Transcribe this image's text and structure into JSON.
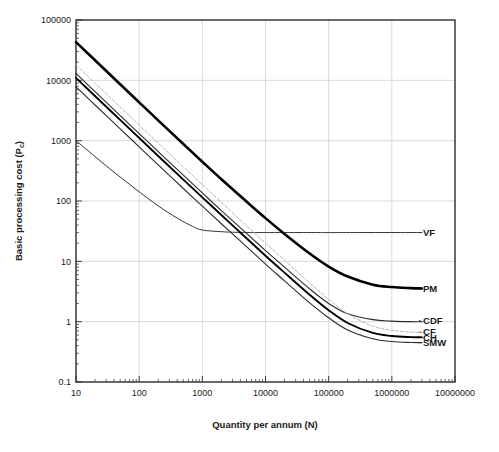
{
  "chart_data": {
    "type": "line",
    "title": "",
    "xlabel": "Quantity per annum (N)",
    "ylabel_prefix": "Basic processing cost (P",
    "ylabel_sub": "c",
    "ylabel_suffix": ")",
    "xscale": "log",
    "yscale": "log",
    "xlim": [
      10,
      10000000
    ],
    "ylim": [
      0.1,
      100000
    ],
    "grid": true,
    "legend_position": "right-inline-labels",
    "xticks": [
      "10",
      "100",
      "1000",
      "10000",
      "100000",
      "1000000",
      "10000000"
    ],
    "xtick_values": [
      10,
      100,
      1000,
      10000,
      100000,
      1000000,
      10000000
    ],
    "yticks": [
      "0.1",
      "1",
      "10",
      "100",
      "1000",
      "10000",
      "100000"
    ],
    "ytick_values": [
      0.1,
      1,
      10,
      100,
      1000,
      10000,
      100000
    ],
    "series": [
      {
        "name": "VF",
        "label": "VF",
        "color": "#333333",
        "width": 1.0,
        "dash": "none",
        "label_x": 2600000,
        "label_y": 30,
        "x": [
          10,
          20,
          40,
          70,
          100,
          200,
          400,
          700,
          1000,
          2000,
          3000,
          5000,
          7000,
          10000,
          20000,
          40000,
          70000,
          100000,
          300000,
          1000000,
          3000000
        ],
        "y": [
          1000,
          545,
          300,
          190,
          142,
          83,
          52,
          38,
          33,
          31,
          30.4,
          30.1,
          30.0,
          30.0,
          30.0,
          30.0,
          30.0,
          30.0,
          30.0,
          30.0,
          30.0
        ]
      },
      {
        "name": "PM",
        "label": "PM",
        "color": "#000000",
        "width": 2.6,
        "dash": "none",
        "label_x": 2600000,
        "label_y": 3.5,
        "x": [
          10,
          20,
          50,
          100,
          200,
          500,
          1000,
          2000,
          5000,
          10000,
          20000,
          50000,
          100000,
          200000,
          500000,
          1000000,
          2000000,
          3000000
        ],
        "y": [
          43000,
          21500,
          8600,
          4320,
          2170,
          880,
          448,
          230,
          98,
          52,
          28.5,
          13.5,
          8.2,
          5.6,
          4.1,
          3.75,
          3.6,
          3.55
        ]
      },
      {
        "name": "CDF",
        "label": "CDF",
        "color": "#2a2a2a",
        "width": 1.1,
        "dash": "none",
        "label_x": 2600000,
        "label_y": 1.05,
        "x": [
          10,
          20,
          50,
          100,
          200,
          500,
          1000,
          2000,
          5000,
          10000,
          20000,
          50000,
          100000,
          200000,
          500000,
          1000000,
          2000000,
          3000000
        ],
        "y": [
          13000,
          6500,
          2610,
          1310,
          660,
          268,
          136,
          69.5,
          29.0,
          15.1,
          8.0,
          3.5,
          2.0,
          1.35,
          1.08,
          1.02,
          1.0,
          1.0
        ]
      },
      {
        "name": "CF",
        "label": "CF",
        "color": "#b4b4b4",
        "width": 1.0,
        "dash": "3,2",
        "label_x": 2600000,
        "label_y": 0.68,
        "x": [
          10,
          20,
          50,
          100,
          200,
          500,
          1000,
          2000,
          5000,
          10000,
          20000,
          50000,
          100000,
          200000,
          500000,
          1000000,
          2000000,
          3000000
        ],
        "y": [
          18000,
          9000,
          3610,
          1810,
          910,
          368,
          187,
          95,
          39.0,
          20.0,
          10.4,
          4.4,
          2.35,
          1.35,
          0.84,
          0.72,
          0.67,
          0.66
        ]
      },
      {
        "name": "CH",
        "label": "CH",
        "color": "#000000",
        "width": 1.9,
        "dash": "none",
        "label_x": 2600000,
        "label_y": 0.55,
        "x": [
          10,
          20,
          50,
          100,
          200,
          500,
          1000,
          2000,
          5000,
          10000,
          20000,
          50000,
          100000,
          200000,
          500000,
          1000000,
          2000000,
          3000000
        ],
        "y": [
          11000,
          5500,
          2210,
          1110,
          558,
          226,
          115,
          58.5,
          24.2,
          12.4,
          6.5,
          2.8,
          1.55,
          0.95,
          0.65,
          0.58,
          0.555,
          0.55
        ]
      },
      {
        "name": "SMW",
        "label": "SMW",
        "color": "#2a2a2a",
        "width": 1.1,
        "dash": "none",
        "label_x": 2600000,
        "label_y": 0.45,
        "x": [
          10,
          20,
          50,
          100,
          200,
          500,
          1000,
          2000,
          5000,
          10000,
          20000,
          50000,
          100000,
          200000,
          500000,
          1000000,
          2000000,
          3000000
        ],
        "y": [
          7800,
          3900,
          1570,
          790,
          396,
          161,
          82,
          42,
          17.5,
          9.0,
          4.75,
          2.05,
          1.16,
          0.73,
          0.52,
          0.468,
          0.452,
          0.45
        ]
      }
    ]
  },
  "colors": {
    "grid": "#c8c8c8",
    "frame": "#2b2b2b",
    "text": "#1a1a1a",
    "background": "#ffffff"
  }
}
